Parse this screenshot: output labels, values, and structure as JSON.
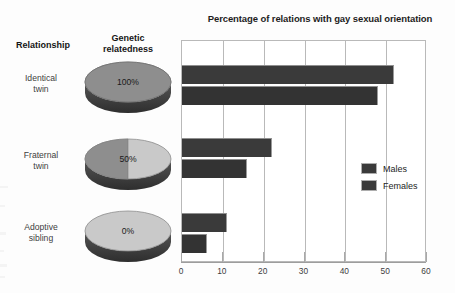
{
  "figure": {
    "headers": {
      "relationship": "Relationship",
      "relatedness_line1": "Genetic",
      "relatedness_line2": "relatedness"
    },
    "rows": [
      {
        "label_line1": "Identical",
        "label_line2": "twin",
        "relatedness": "100%",
        "relatedness_fraction": 1.0
      },
      {
        "label_line1": "Fraternal",
        "label_line2": "twin",
        "relatedness": "50%",
        "relatedness_fraction": 0.5
      },
      {
        "label_line1": "Adoptive",
        "label_line2": "sibling",
        "relatedness": "0%",
        "relatedness_fraction": 0.0
      }
    ],
    "colors": {
      "bar": "#3a3a3a",
      "disc_dark": "#8e8e8e",
      "disc_light": "#c9c9c9",
      "gridline": "#b9b9b9",
      "text": "#1d1d1d"
    }
  },
  "chart_data": {
    "type": "bar",
    "orientation": "horizontal",
    "title": "Percentage of relations with gay sexual orientation",
    "xlabel": "",
    "ylabel": "",
    "categories": [
      "Identical twin",
      "Fraternal twin",
      "Adoptive sibling"
    ],
    "series": [
      {
        "name": "Males",
        "values": [
          52,
          22,
          11
        ]
      },
      {
        "name": "Females",
        "values": [
          48,
          16,
          6
        ]
      }
    ],
    "xlim": [
      0,
      60
    ],
    "xticks": [
      0,
      10,
      20,
      30,
      40,
      50,
      60
    ],
    "xticklabels": [
      "0",
      "10",
      "20",
      "30",
      "40",
      "50",
      "60"
    ],
    "grid": true,
    "legend_position": "center-right",
    "legend_entries": [
      "Males",
      "Females"
    ]
  }
}
